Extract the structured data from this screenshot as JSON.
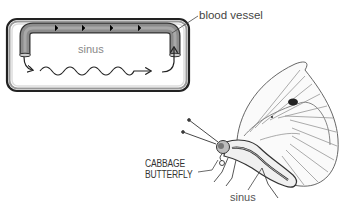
{
  "diagram": {
    "schematic": {
      "labels": {
        "sinus": "sinus",
        "blood_vessel": "blood vessel"
      }
    },
    "butterfly": {
      "labels": {
        "species_line1": "CABBAGE",
        "species_line2": "BUTTERFLY",
        "sinus": "sinus"
      }
    },
    "colors": {
      "vessel_fill": "#8a8a8a",
      "box_outline": "#2a2a2a",
      "line": "#333333",
      "background": "#ffffff"
    }
  }
}
